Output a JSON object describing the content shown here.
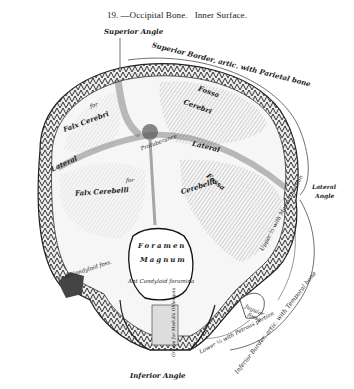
{
  "figure": {
    "number": "19.",
    "title": "—Occipital Bone.",
    "subtitle": "Inner Surface."
  },
  "labels": {
    "superior_angle": "Superior Angle",
    "superior_border": "Superior Border, artic. with Parietal bone",
    "fossa_cerebri_upper": "Fossa",
    "cerebri": "Cerebri",
    "for_falx_cerebri_for": "for",
    "falx_cerebri": "Falx Cerebri",
    "protuberance": "Protuberance",
    "lateral_left": "Lateral",
    "lateral_right": "Lateral",
    "falx_cerebelli": "Falx Cerebelli",
    "for_cerebelli": "for",
    "cerebelli_fossa": "Cerebelli",
    "fossa_cerebelli": "Fossa",
    "lateral_angle_1": "Lateral",
    "lateral_angle_2": "Angle",
    "foramen": "Foramen",
    "magnum": "Magnum",
    "ant_condyloid": "Ant Condyloid foramina",
    "post_condyloid": "Post Condyloid foss.",
    "groove_medulla": "Groove for Medulla Oblongata",
    "jugular_fossa_1": "Jugular",
    "jugular_fossa_2": "fossa",
    "upper_mastoid": "Upper ⅔ with Mastoid portion",
    "lower_petrous": "Lower ⅓ with Petrous portion",
    "inferior_border": "Inferior Border, artic. with Temporal bone",
    "inferior_angle": "Inferior Angle"
  },
  "colors": {
    "ink": "#222222",
    "bone_fill": "#f4f4f4",
    "shade": "#8a8a8a",
    "dark": "#3a3a3a"
  }
}
